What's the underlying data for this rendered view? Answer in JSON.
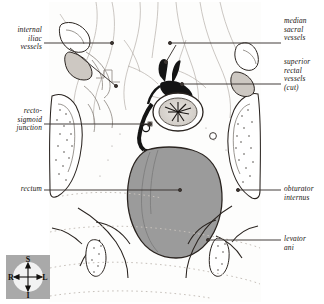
{
  "plate": {
    "title": "Pelvic dissection — rectum and associated vessels",
    "background_color": "#ffffff",
    "ink_color": "#1a1613",
    "rectum_fill": "#9b9b9b",
    "vessel_dark": "#141414",
    "faint_line": "#b9b3ad",
    "dotted_line": "#c9c3bd"
  },
  "labels": {
    "internal_iliac_vessels": "internal\niliac\nvessels",
    "recto_sigmoid_junction": "recto-\nsigmoid\njunction",
    "rectum": "rectum",
    "median_sacral_vessels": "median\nsacral\nvessels",
    "superior_rectal_vessels": "superior\nrectal\nvessels\n(cut)",
    "obturator_internus": "obturator\ninternus",
    "levator_ani": "levator\nani"
  },
  "compass": {
    "superior": "S",
    "inferior": "I",
    "right": "R",
    "left": "L",
    "box_color": "#a9a9a9",
    "disc_color": "#f2f2f2"
  }
}
